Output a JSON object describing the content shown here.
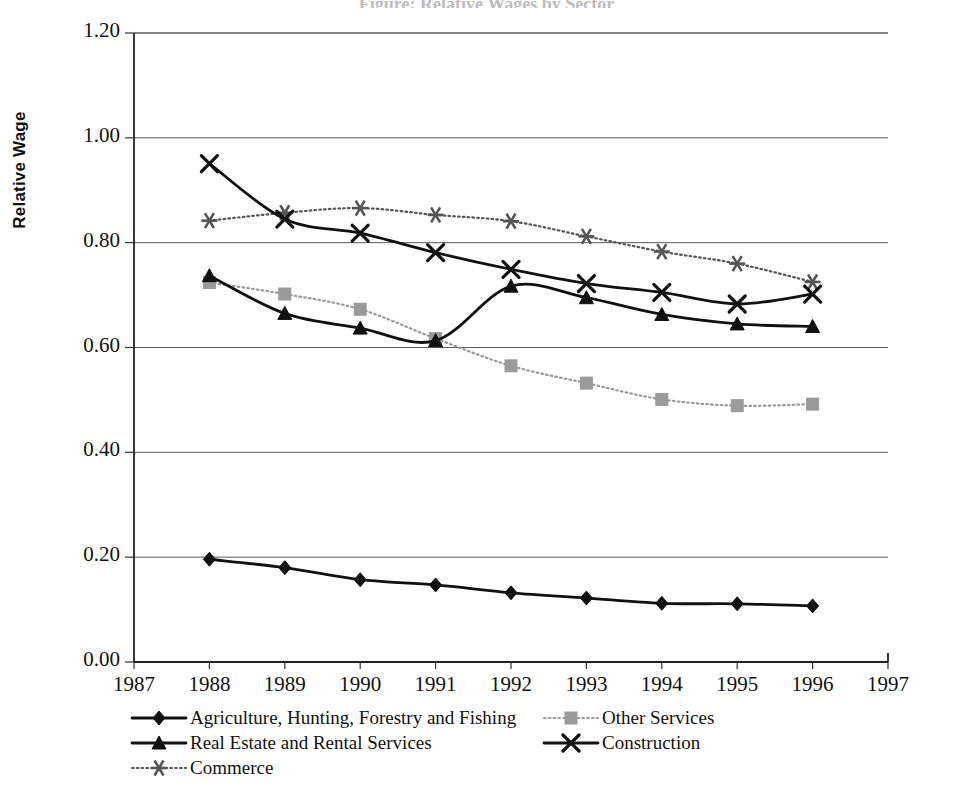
{
  "title_remnant": "Figure: Relative Wages by Sector",
  "axes": {
    "ylabel": "Relative Wage",
    "yticks": [
      "1.20",
      "1.00",
      "0.80",
      "0.60",
      "0.40",
      "0.20",
      "0.00"
    ],
    "xticks": [
      "1987",
      "1988",
      "1989",
      "1990",
      "1991",
      "1992",
      "1993",
      "1994",
      "1995",
      "1996",
      "1997"
    ]
  },
  "legend": {
    "left": [
      {
        "label": "Agriculture, Hunting, Forestry and Fishing",
        "marker": "diamond-marker",
        "color": "#111111",
        "dash": "solid"
      },
      {
        "label": "Real Estate and Rental Services",
        "marker": "triangle-marker",
        "color": "#111111",
        "dash": "solid"
      },
      {
        "label": "Commerce",
        "marker": "asterisk-marker",
        "color": "#555555",
        "dash": "dotted"
      }
    ],
    "right": [
      {
        "label": "Other Services",
        "marker": "square-marker",
        "color": "#9a9a9a",
        "dash": "dotted"
      },
      {
        "label": "Construction",
        "marker": "x-marker",
        "color": "#111111",
        "dash": "solid"
      }
    ]
  },
  "chart_data": {
    "type": "line",
    "title": "",
    "xlabel": "",
    "ylabel": "Relative Wage",
    "xlim": [
      1987,
      1997
    ],
    "ylim": [
      0.0,
      1.2
    ],
    "ytick_step": 0.2,
    "grid": "horizontal",
    "legend_position": "bottom",
    "x": [
      1988,
      1989,
      1990,
      1991,
      1992,
      1993,
      1994,
      1995,
      1996
    ],
    "series": [
      {
        "name": "Agriculture, Hunting, Forestry and Fishing",
        "marker": "diamond",
        "color": "#111111",
        "dash": "solid",
        "values": [
          0.196,
          0.18,
          0.157,
          0.147,
          0.132,
          0.122,
          0.112,
          0.111,
          0.107
        ]
      },
      {
        "name": "Real Estate and Rental Services",
        "marker": "triangle",
        "color": "#111111",
        "dash": "solid",
        "values": [
          0.737,
          0.665,
          0.637,
          0.613,
          0.717,
          0.695,
          0.663,
          0.645,
          0.64
        ]
      },
      {
        "name": "Commerce",
        "marker": "asterisk",
        "color": "#555555",
        "dash": "dotted",
        "values": [
          0.842,
          0.857,
          0.866,
          0.853,
          0.841,
          0.812,
          0.783,
          0.76,
          0.725
        ]
      },
      {
        "name": "Other Services",
        "marker": "square",
        "color": "#9a9a9a",
        "dash": "dotted",
        "values": [
          0.724,
          0.702,
          0.673,
          0.617,
          0.565,
          0.532,
          0.501,
          0.489,
          0.492
        ]
      },
      {
        "name": "Construction",
        "marker": "x",
        "color": "#111111",
        "dash": "solid",
        "values": [
          0.951,
          0.845,
          0.818,
          0.781,
          0.749,
          0.722,
          0.705,
          0.683,
          0.702
        ]
      }
    ]
  }
}
